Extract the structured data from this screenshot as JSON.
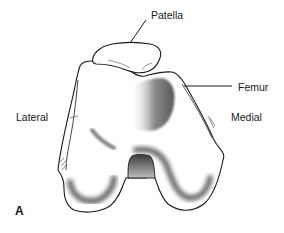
{
  "figure": {
    "panel_label": "A",
    "labels": {
      "patella": "Patella",
      "femur": "Femur",
      "lateral": "Lateral",
      "medial": "Medial"
    },
    "colors": {
      "outline": "#1a1a1a",
      "shading": "#555555",
      "background": "#ffffff"
    }
  }
}
